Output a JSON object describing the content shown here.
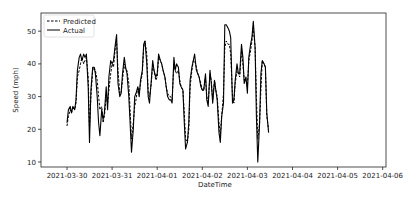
{
  "chart_data": {
    "type": "line",
    "title": "",
    "xlabel": "DateTime",
    "ylabel": "Speed (mph)",
    "ylim": [
      8.4,
      55.5
    ],
    "xlim": [
      "2021-03-29 12:00",
      "2021-04-06 00:00"
    ],
    "grid": false,
    "legend_position": "upper left",
    "x_ticks": [
      "2021-03-30",
      "2021-03-31",
      "2021-04-01",
      "2021-04-02",
      "2021-04-03",
      "2021-04-04",
      "2021-04-05",
      "2021-04-06"
    ],
    "y_ticks": [
      10,
      20,
      30,
      40,
      50
    ],
    "x_days": [
      0.0,
      0.03,
      0.07,
      0.1,
      0.13,
      0.17,
      0.2,
      0.23,
      0.27,
      0.3,
      0.33,
      0.37,
      0.4,
      0.43,
      0.47,
      0.5,
      0.53,
      0.57,
      0.6,
      0.63,
      0.67,
      0.7,
      0.73,
      0.77,
      0.8,
      0.83,
      0.87,
      0.9,
      0.93,
      0.97,
      1.0,
      1.03,
      1.07,
      1.1,
      1.13,
      1.17,
      1.2,
      1.23,
      1.27,
      1.3,
      1.33,
      1.37,
      1.4,
      1.43,
      1.47,
      1.5,
      1.53,
      1.57,
      1.6,
      1.63,
      1.67,
      1.7,
      1.73,
      1.77,
      1.8,
      1.83,
      1.87,
      1.9,
      1.93,
      1.97,
      2.0,
      2.03,
      2.07,
      2.1,
      2.13,
      2.17,
      2.2,
      2.23,
      2.27,
      2.3,
      2.33,
      2.37,
      2.4,
      2.43,
      2.47,
      2.5,
      2.53,
      2.57,
      2.6,
      2.63,
      2.67,
      2.7,
      2.73,
      2.77,
      2.8,
      2.83,
      2.87,
      2.9,
      2.93,
      2.97,
      3.0,
      3.03,
      3.07,
      3.1,
      3.13,
      3.17,
      3.2,
      3.23,
      3.27,
      3.3,
      3.33,
      3.37,
      3.4,
      3.43,
      3.47,
      3.5,
      3.53,
      3.57,
      3.6,
      3.63,
      3.67,
      3.7,
      3.73,
      3.77,
      3.8,
      3.83,
      3.87,
      3.9,
      3.93,
      3.97,
      4.0,
      4.03,
      4.07,
      4.1,
      4.13,
      4.17,
      4.2,
      4.23,
      4.27,
      4.3,
      4.33,
      4.37,
      4.4,
      4.43,
      4.47,
      4.5,
      4.53,
      4.57,
      4.6,
      4.63,
      4.67,
      4.7,
      4.73,
      4.77,
      4.8,
      4.83,
      4.87,
      4.9,
      4.93,
      4.97,
      5.0,
      5.03,
      5.07,
      5.1,
      5.13,
      5.17,
      5.2,
      5.23,
      5.27,
      5.3,
      5.33,
      5.37,
      5.4,
      5.43,
      5.47,
      5.5,
      5.53,
      5.57,
      5.6
    ],
    "series": [
      {
        "name": "Predicted",
        "style": "dashed",
        "color": "#000000",
        "values": [
          21,
          24,
          26,
          25,
          27,
          26,
          28,
          36,
          38,
          40,
          42,
          40,
          41,
          42,
          36,
          20,
          30,
          38,
          39,
          38,
          35,
          30,
          26,
          27,
          22,
          24,
          30,
          28,
          32,
          37,
          40,
          39,
          45,
          47,
          38,
          31,
          31,
          35,
          40,
          38,
          38,
          34,
          26,
          17,
          22,
          27,
          29,
          33,
          31,
          34,
          37,
          45,
          47,
          43,
          31,
          30,
          34,
          40,
          38,
          35,
          36,
          42,
          41,
          40,
          38,
          36,
          33,
          31,
          30,
          30,
          29,
          40,
          38,
          37,
          38,
          35,
          33,
          32,
          25,
          17,
          16,
          20,
          33,
          38,
          41,
          41,
          39,
          37,
          36,
          34,
          32,
          32,
          36,
          30,
          28,
          37,
          35,
          29,
          35,
          32,
          30,
          22,
          18,
          24,
          31,
          45,
          47,
          46,
          46,
          43,
          30,
          28,
          34,
          38,
          37,
          36,
          44,
          40,
          35,
          35,
          33,
          41,
          44,
          47,
          51,
          45,
          30,
          17,
          22,
          32,
          41,
          40,
          39,
          24,
          20
        ]
      },
      {
        "name": "Actual",
        "style": "solid",
        "color": "#000000",
        "values": [
          22,
          26,
          27,
          25,
          27,
          26,
          29,
          38,
          42,
          43,
          41,
          43,
          42,
          43,
          33,
          16,
          32,
          39,
          39,
          37,
          30,
          22,
          18,
          26,
          23,
          25,
          33,
          26,
          36,
          41,
          40,
          41,
          46,
          49,
          34,
          30,
          31,
          37,
          42,
          39,
          37,
          30,
          22,
          13,
          20,
          30,
          31,
          33,
          30,
          35,
          38,
          46,
          47,
          40,
          30,
          28,
          35,
          41,
          38,
          36,
          37,
          43,
          41,
          40,
          38,
          36,
          33,
          30,
          29,
          29,
          28,
          42,
          38,
          40,
          39,
          34,
          33,
          32,
          22,
          14,
          16,
          22,
          35,
          39,
          41,
          43,
          38,
          37,
          36,
          33,
          32,
          32,
          37,
          29,
          27,
          38,
          34,
          28,
          35,
          32,
          29,
          19,
          16,
          24,
          28,
          52,
          52,
          51,
          50,
          48,
          28,
          29,
          35,
          40,
          37,
          37,
          46,
          42,
          34,
          36,
          31,
          42,
          46,
          48,
          53,
          45,
          24,
          10,
          22,
          37,
          41,
          40,
          39,
          25,
          19
        ]
      }
    ]
  },
  "legend": {
    "items": [
      {
        "label": "Predicted",
        "style": "dashed"
      },
      {
        "label": "Actual",
        "style": "solid"
      }
    ]
  },
  "axes": {
    "xlabel": "DateTime",
    "ylabel": "Speed (mph)",
    "x_ticks": [
      "2021-03-30",
      "2021-03-31",
      "2021-04-01",
      "2021-04-02",
      "2021-04-03",
      "2021-04-04",
      "2021-04-05",
      "2021-04-06"
    ],
    "y_ticks": [
      "10",
      "20",
      "30",
      "40",
      "50"
    ]
  }
}
